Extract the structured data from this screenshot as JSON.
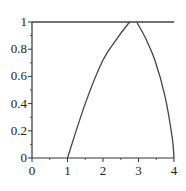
{
  "chart_data": {
    "type": "line",
    "title": "",
    "xlabel": "",
    "ylabel": "",
    "xlim": [
      0,
      4
    ],
    "ylim": [
      0,
      1
    ],
    "grid": false,
    "x_ticks": [
      "0",
      "1",
      "2",
      "3",
      "4"
    ],
    "y_ticks": [
      "0",
      "0.2",
      "0.4",
      "0.6",
      "0.8",
      "1"
    ],
    "series": [
      {
        "name": "rising-curve",
        "x": [
          1,
          1.5,
          2,
          2.4,
          2.75
        ],
        "y": [
          0,
          0.4,
          0.72,
          0.88,
          1
        ]
      },
      {
        "name": "falling-curve",
        "x": [
          2.95,
          3.2,
          3.46,
          3.75,
          3.95,
          4
        ],
        "y": [
          1,
          0.88,
          0.72,
          0.45,
          0.15,
          0
        ]
      },
      {
        "name": "top-line",
        "x": [
          0,
          4
        ],
        "y": [
          1,
          1
        ]
      }
    ]
  },
  "colors": {
    "axis": "#333333",
    "curve": "#444444"
  }
}
